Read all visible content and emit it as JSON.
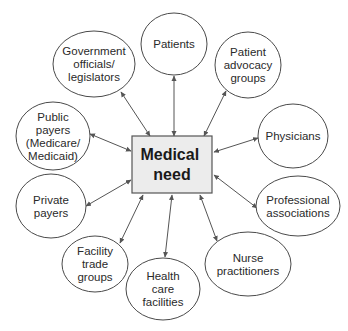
{
  "center": {
    "lines": [
      "Medical",
      "need"
    ],
    "fill": "#ececec",
    "x": 132,
    "y": 136,
    "w": 80,
    "h": 57
  },
  "nodes": [
    {
      "id": "patients",
      "lines": [
        "Patients"
      ],
      "cx": 174,
      "cy": 44,
      "rx": 33,
      "ry": 31,
      "from": [
        174,
        136
      ],
      "to": [
        174,
        76
      ]
    },
    {
      "id": "patient-advocacy-groups",
      "lines": [
        "Patient",
        "advocacy",
        "groups"
      ],
      "cx": 248,
      "cy": 65,
      "rx": 33,
      "ry": 33,
      "from": [
        204,
        136
      ],
      "to": [
        226,
        91
      ]
    },
    {
      "id": "physicians",
      "lines": [
        "Physicians"
      ],
      "cx": 293,
      "cy": 136,
      "rx": 35,
      "ry": 32,
      "from": [
        214,
        152
      ],
      "to": [
        258,
        138
      ]
    },
    {
      "id": "professional-associations",
      "lines": [
        "Professional",
        "associations"
      ],
      "cx": 298,
      "cy": 206,
      "rx": 42,
      "ry": 30,
      "from": [
        214,
        175
      ],
      "to": [
        257,
        208
      ]
    },
    {
      "id": "nurse-practitioners",
      "lines": [
        "Nurse",
        "practitioners"
      ],
      "cx": 248,
      "cy": 264,
      "rx": 43,
      "ry": 32,
      "from": [
        200,
        195
      ],
      "to": [
        217,
        241
      ]
    },
    {
      "id": "health-care-facilities",
      "lines": [
        "Health",
        "care",
        "facilities"
      ],
      "cx": 163,
      "cy": 289,
      "rx": 37,
      "ry": 31,
      "from": [
        172,
        195
      ],
      "to": [
        165,
        257
      ]
    },
    {
      "id": "facility-trade-groups",
      "lines": [
        "Facility",
        "trade",
        "groups"
      ],
      "cx": 95,
      "cy": 264,
      "rx": 33,
      "ry": 28,
      "from": [
        143,
        195
      ],
      "to": [
        120,
        243
      ]
    },
    {
      "id": "private-payers",
      "lines": [
        "Private",
        "payers"
      ],
      "cx": 51,
      "cy": 206,
      "rx": 35,
      "ry": 32,
      "from": [
        131,
        180
      ],
      "to": [
        86,
        206
      ]
    },
    {
      "id": "public-payers",
      "lines": [
        "Public",
        "payers",
        "(Medicare/",
        "Medicaid)"
      ],
      "cx": 53,
      "cy": 136,
      "rx": 37,
      "ry": 34,
      "from": [
        131,
        151
      ],
      "to": [
        90,
        134
      ]
    },
    {
      "id": "government-officials-legislators",
      "lines": [
        "Government",
        "officials/",
        "legislators"
      ],
      "cx": 94,
      "cy": 64,
      "rx": 41,
      "ry": 33,
      "from": [
        150,
        136
      ],
      "to": [
        121,
        92
      ]
    }
  ],
  "style": {
    "arrow_color": "#555555",
    "ellipse_stroke": "#4a4a4a",
    "text_color": "#2a2a2a"
  }
}
